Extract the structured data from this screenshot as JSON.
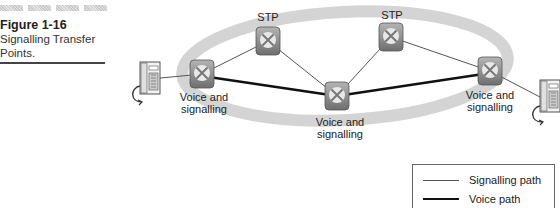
{
  "caption": {
    "figure_number": "Figure 1-16",
    "title_line1": "Signalling Transfer",
    "title_line2": "Points."
  },
  "nodes": {
    "stp_left": {
      "label": "STP"
    },
    "stp_right": {
      "label": "STP"
    },
    "vs_left": {
      "label_line1": "Voice and",
      "label_line2": "signalling"
    },
    "vs_middle": {
      "label_line1": "Voice and",
      "label_line2": "signalling"
    },
    "vs_right": {
      "label_line1": "Voice and",
      "label_line2": "signalling"
    }
  },
  "legend": {
    "signalling": "Signalling path",
    "voice": "Voice path"
  },
  "colors": {
    "ellipse": "#d6d6d6",
    "signalling_line": "#555555",
    "voice_line": "#111111",
    "switch_fill": "#9a9a9a"
  }
}
